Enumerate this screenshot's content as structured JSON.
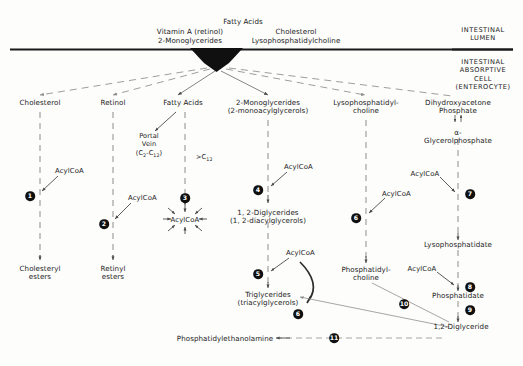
{
  "figure": {
    "membrane_color": "#1a1a1a",
    "arrow_color": "#4a4a4a",
    "dashed_color": "#8c8c8c",
    "text_color": "#1b1b1b",
    "node_badge_color": "#101010"
  },
  "lumen": {
    "substrates": [
      {
        "id": "vitamin-a",
        "label": "Vitamin A (retinol)"
      },
      {
        "id": "monoglycerides",
        "label": "2-Monoglycerides"
      },
      {
        "id": "fatty-acids",
        "label": "Fatty Acids"
      },
      {
        "id": "cholesterol",
        "label": "Cholesterol"
      },
      {
        "id": "lysophosphatidylcholine",
        "label": "Lysophosphatidylcholine"
      }
    ]
  },
  "compartments": {
    "lumen_label": "INTESTINAL\nLUMEN",
    "cell_label": "INTESTINAL\nABSORPTIVE CELL\n(ENTEROCYTE)"
  },
  "columns": {
    "cholesterol": {
      "head": "Cholesterol",
      "product": "Cholesteryl\nesters",
      "reagent": "AcylCoA",
      "step": "1"
    },
    "retinol": {
      "head": "Retinol",
      "product": "Retinyl\nesters",
      "reagent": "AcylCoA",
      "step": "2"
    },
    "fatty_acids": {
      "head": "Fatty Acids",
      "portal_vein": "Portal\nVein",
      "portal_chain": "(C2-C12)",
      "long_chain": ">C12",
      "activated": "AcylCoA",
      "step": "3"
    },
    "monoglycerides": {
      "head": "2-Monoglycerides\n(2-monoacylglycerols)",
      "reagent": "AcylCoA",
      "step": "4",
      "product": "1, 2-Diglycerides\n(1, 2-diacylglycerols)",
      "reagent2": "AcylCoA",
      "step2": "5",
      "product2": "Triglycerides\n(triacylglycerols)",
      "step_converge": "6"
    },
    "lysophosphatidylcholine": {
      "head": "Lysophosphatidyl-\ncholine",
      "reagent": "AcylCoA",
      "step": "6",
      "product": "Phosphatidyl-\ncholine"
    },
    "glycerophosphate": {
      "head": "Dihydroxyacetone\nPhosphate",
      "head2": "a-Glycerolphosphate",
      "reagent": "AcylCoA",
      "step": "7",
      "product": "Lysophosphatidate",
      "reagent2": "AcylCoA",
      "step2": "8",
      "product2": "Phosphatidate",
      "step3": "9",
      "product3": "1,2-Diglyceride"
    }
  },
  "bottom": {
    "phosphatidylethanolamine": "Phosphatidylethanolamine",
    "step": "11",
    "step_pc": "10"
  }
}
